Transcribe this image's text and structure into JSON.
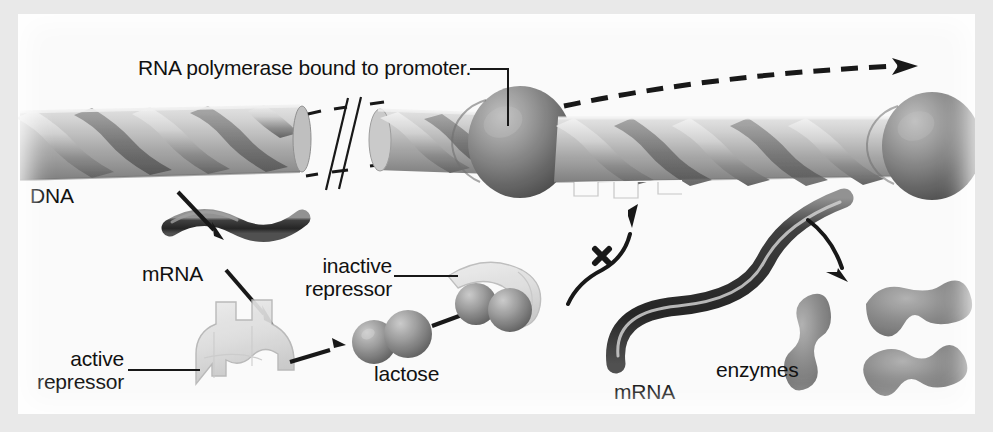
{
  "figure": {
    "title_caption": "RNA polymerase bound to promoter.",
    "background_color": "#fafafa",
    "frame_color": "#e9e9e9",
    "ink_color": "#111111"
  },
  "labels": {
    "promoter_note": "RNA polymerase bound to promoter.",
    "dna": "DNA",
    "mrna_left": "mRNA",
    "active_repressor_line1": "active",
    "active_repressor_line2": "repressor",
    "inactive_repressor_line1": "inactive",
    "inactive_repressor_line2": "repressor",
    "lactose": "lactose",
    "mrna_right": "mRNA",
    "enzymes": "enzymes"
  },
  "structures": {
    "dna_strand": "double-helix-ribbon",
    "break_symbol": "double-slash-break",
    "polymerase_left": "rna-polymerase-sphere",
    "polymerase_right": "rna-polymerase-sphere",
    "operator_notch": "operator-site-notch",
    "active_repressor_shape": "blocky-translucent-repressor",
    "inactive_repressor_shape": "collapsed-crescent-repressor",
    "lactose_molecule": "two-bonded-spheres",
    "mrna_transcript_left": "wavy-dark-strand",
    "mrna_transcript_right": "s-curved-dark-strand",
    "enzyme_blobs": [
      "enzyme-blob-1",
      "enzyme-blob-2",
      "enzyme-blob-3"
    ]
  },
  "arrows": {
    "transcription_direction": "dashed-arrow-right",
    "dna_to_mrna": "solid-arrow-down-right",
    "mrna_to_active_repressor": "solid-arrow-down-right",
    "active_repressor_to_lactose": "solid-arrow-right",
    "lactose_to_inactive_repressor": "solid-arrow-up-right",
    "blocked_binding": "curved-arrow-with-x",
    "blocked_marker": "x",
    "mrna_to_enzymes": "curved-arrow-down-right"
  },
  "colors": {
    "dna_light": "#d8d8d8",
    "dna_mid": "#a9a9a9",
    "dna_dark": "#6f6f6f",
    "sphere_light": "#b6b6b6",
    "sphere_dark": "#555555",
    "mrna_dark": "#2c2c2c",
    "enzyme_gray": "#8d8d8d",
    "repressor_pale": "#dcdcdc",
    "ink": "#111111"
  }
}
